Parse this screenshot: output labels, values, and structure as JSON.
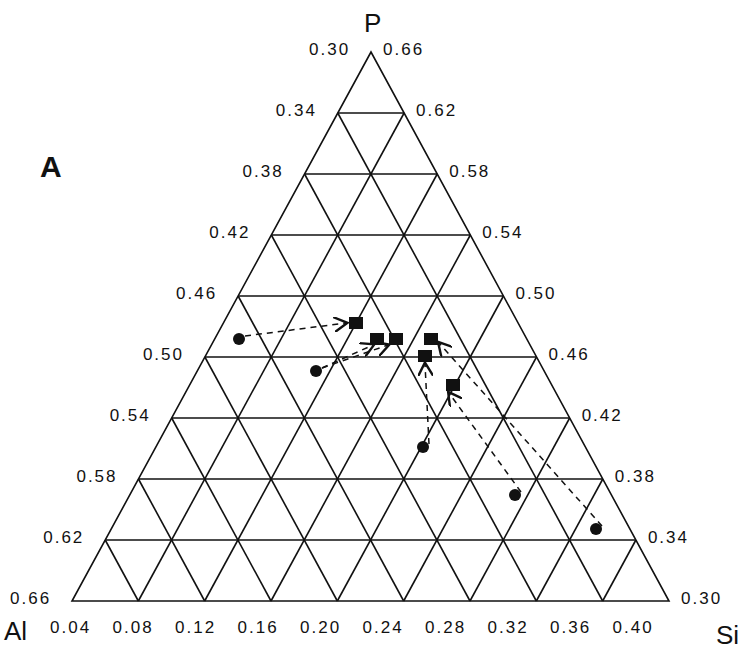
{
  "chart_data": {
    "type": "scatter",
    "subtype": "ternary",
    "title": "",
    "panel_label": "A",
    "vertices": {
      "top": "P",
      "left": "Al",
      "right": "Si"
    },
    "axes": {
      "left_ticks": [
        "0.30",
        "0.34",
        "0.38",
        "0.42",
        "0.46",
        "0.50",
        "0.54",
        "0.58",
        "0.62",
        "0.66"
      ],
      "right_ticks": [
        "0.66",
        "0.62",
        "0.58",
        "0.54",
        "0.50",
        "0.46",
        "0.42",
        "0.38",
        "0.34",
        "0.30"
      ],
      "bottom_ticks": [
        "0.04",
        "0.08",
        "0.12",
        "0.16",
        "0.20",
        "0.24",
        "0.28",
        "0.32",
        "0.36",
        "0.40"
      ]
    },
    "grid": true,
    "legend": null,
    "series": [
      {
        "name": "circles (initial)",
        "marker": "circle",
        "points": [
          {
            "Si": 0.14,
            "P": 0.48
          },
          {
            "Si": 0.19,
            "P": 0.5
          },
          {
            "Si": 0.26,
            "P": 0.55
          },
          {
            "Si": 0.32,
            "P": 0.58
          },
          {
            "Si": 0.37,
            "P": 0.61
          }
        ]
      },
      {
        "name": "squares (final)",
        "marker": "square",
        "points": [
          {
            "Si": 0.19,
            "P": 0.47
          },
          {
            "Si": 0.21,
            "P": 0.48
          },
          {
            "Si": 0.22,
            "P": 0.48
          },
          {
            "Si": 0.25,
            "P": 0.48
          },
          {
            "Si": 0.25,
            "P": 0.49
          },
          {
            "Si": 0.26,
            "P": 0.51
          }
        ]
      }
    ],
    "arrows": [
      {
        "from": "circle 1",
        "to": "square 1"
      },
      {
        "from": "circle 2",
        "to": "square 2"
      },
      {
        "from": "circle 2",
        "to": "square 3"
      },
      {
        "from": "circle 3",
        "to": "square 5"
      },
      {
        "from": "circle 4",
        "to": "square 6"
      },
      {
        "from": "circle 5",
        "to": "square 4"
      }
    ]
  },
  "labels": {
    "panel": "A",
    "apex_top": "P",
    "apex_left": "Al",
    "apex_right": "Si"
  }
}
